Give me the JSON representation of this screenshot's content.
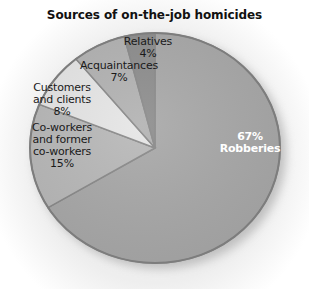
{
  "chart_data": {
    "type": "pie",
    "title": "Sources of on-the-job homicides",
    "categories": [
      "Robberies",
      "Co-workers and former co-workers",
      "Customers and clients",
      "Acquaintances",
      "Relatives"
    ],
    "values": [
      67,
      15,
      8,
      7,
      4
    ],
    "unit": "%",
    "colors": [
      "#a9a9a9",
      "#b9b9b9",
      "#e6e6e6",
      "#b3b3b3",
      "#8e8e8e"
    ],
    "labels": [
      {
        "category": "Robberies",
        "text": "67%\nRobberies"
      },
      {
        "category": "Co-workers and former co-workers",
        "text": "Co-workers\nand former\nco-workers\n15%"
      },
      {
        "category": "Customers and clients",
        "text": "Customers\nand clients\n8%"
      },
      {
        "category": "Acquaintances",
        "text": "Acquaintances\n7%"
      },
      {
        "category": "Relatives",
        "text": "Relatives\n4%"
      }
    ],
    "legend": "none (labels inside slices)",
    "start_angle": "12 o'clock, clockwise"
  }
}
